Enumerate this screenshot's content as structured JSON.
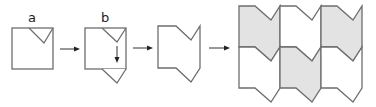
{
  "diagram": {
    "steps": [
      {
        "id": "a",
        "label": "a",
        "description": "square with triangular notch cut from top-right edge"
      },
      {
        "id": "b",
        "label": "b",
        "description": "notch translated downward to bottom edge"
      },
      {
        "id": "c",
        "label": "",
        "description": "resulting tile shape"
      },
      {
        "id": "d",
        "label": "",
        "description": "tile tessellation, 3 columns x 2 rows, alternating shading"
      }
    ],
    "tiling": {
      "columns": 3,
      "rows": 2,
      "shaded": [
        [
          true,
          false,
          true
        ],
        [
          false,
          true,
          false
        ]
      ]
    },
    "colors": {
      "stroke": "#6e6e6e",
      "shaded_fill": "#e3e3e3",
      "arrow": "#222222"
    }
  }
}
